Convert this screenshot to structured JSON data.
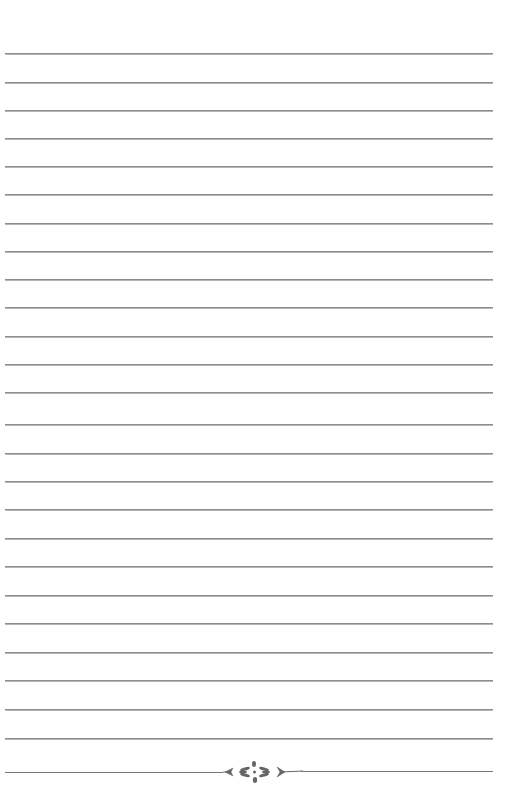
{
  "page": {
    "type": "lined-notebook-page",
    "background_color": "#ffffff",
    "line_color": "#8c8c8c",
    "line_count": 25,
    "line_start_x": 5,
    "line_end_x": 493,
    "line_y_positions": [
      53,
      82,
      110,
      138,
      166,
      194,
      223,
      251,
      279,
      307,
      336,
      364,
      392,
      424,
      453,
      481,
      509,
      538,
      566,
      595,
      623,
      652,
      680,
      709,
      738
    ]
  },
  "ornament": {
    "icon": "floral-divider-icon",
    "y": 772,
    "color": "#666666"
  }
}
